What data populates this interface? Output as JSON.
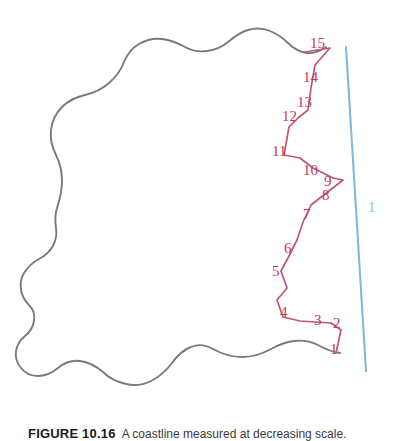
{
  "figure": {
    "caption_number": "FIGURE 10.16",
    "caption_text": "A coastline measured at decreasing scale.",
    "colors": {
      "coastline_outline": "#7a7a7a",
      "polyline": "#c0566e",
      "vertex_label": "#c03a5b",
      "straight_line": "#7fb6d9",
      "straight_line_label": "#8fc0dd",
      "background": "#ffffff"
    }
  },
  "straight_line": {
    "label": "1",
    "label_x": 368,
    "label_y": 200,
    "x1": 346,
    "y1": 47,
    "x2": 366,
    "y2": 371
  },
  "vertex_labels": [
    {
      "label": "1",
      "x": 330,
      "y": 342
    },
    {
      "label": "2",
      "x": 333,
      "y": 316
    },
    {
      "label": "3",
      "x": 314,
      "y": 313
    },
    {
      "label": "4",
      "x": 280,
      "y": 305
    },
    {
      "label": "5",
      "x": 272,
      "y": 264
    },
    {
      "label": "6",
      "x": 284,
      "y": 241
    },
    {
      "label": "7",
      "x": 303,
      "y": 207
    },
    {
      "label": "8",
      "x": 322,
      "y": 188
    },
    {
      "label": "9",
      "x": 324,
      "y": 174
    },
    {
      "label": "10",
      "x": 303,
      "y": 163
    },
    {
      "label": "11",
      "x": 272,
      "y": 144
    },
    {
      "label": "12",
      "x": 282,
      "y": 109
    },
    {
      "label": "13",
      "x": 297,
      "y": 95
    },
    {
      "label": "14",
      "x": 303,
      "y": 70
    },
    {
      "label": "15",
      "x": 310,
      "y": 36
    }
  ],
  "coastline_path": "M 340,353 C 332,352 325,349 318,345 C 310,341 302,340 294,341 C 286,342 278,345 271,349 C 262,354 252,357 242,357 C 232,357 222,354 213,349 C 206,345 198,344 191,347 C 183,350 177,356 172,363 C 166,371 159,377 151,381 C 143,385 134,386 126,384 C 117,382 109,378 103,372 C 96,366 88,362 80,361 C 72,360 64,363 58,368 C 52,373 45,376 38,376 C 31,376 25,373 21,368 C 17,363 15,357 16,351 C 17,345 20,340 25,336 C 30,332 33,327 34,321 C 35,315 33,309 29,305 C 25,301 22,296 21,290 C 20,284 21,278 24,273 C 28,267 33,262 39,259 C 45,256 50,251 53,246 C 56,240 57,234 56,228 C 55,221 55,214 57,208 C 60,199 62,190 62,181 C 62,172 60,163 56,155 C 52,147 50,138 51,130 C 52,121 56,113 62,107 C 68,101 76,97 85,95 C 94,93 102,89 109,83 C 116,77 121,70 124,62 C 127,55 132,48 139,44 C 146,40 154,38 162,39 C 170,40 178,43 185,47 C 192,51 199,52 207,51 C 215,50 222,47 228,42 C 234,37 240,32 248,30 C 255,28 263,28 270,31 C 277,34 283,38 288,43 C 293,48 300,52 307,53 C 314,54 320,51 326,47",
  "polyline_points": [
    [
      336,
      353
    ],
    [
      341,
      330
    ],
    [
      331,
      323
    ],
    [
      300,
      321
    ],
    [
      283,
      317
    ],
    [
      277,
      300
    ],
    [
      287,
      288
    ],
    [
      281,
      271
    ],
    [
      288,
      258
    ],
    [
      297,
      240
    ],
    [
      303,
      222
    ],
    [
      311,
      205
    ],
    [
      343,
      180
    ],
    [
      333,
      178
    ],
    [
      313,
      168
    ],
    [
      300,
      158
    ],
    [
      284,
      155
    ],
    [
      289,
      127
    ],
    [
      298,
      118
    ],
    [
      308,
      110
    ],
    [
      311,
      88
    ],
    [
      315,
      65
    ],
    [
      330,
      48
    ],
    [
      305,
      52
    ]
  ],
  "polyline_vertex_order": [
    "1",
    "2",
    "3",
    "4",
    "5",
    "6",
    "7",
    "8",
    "9",
    "10",
    "11",
    "12",
    "13",
    "14",
    "15"
  ]
}
